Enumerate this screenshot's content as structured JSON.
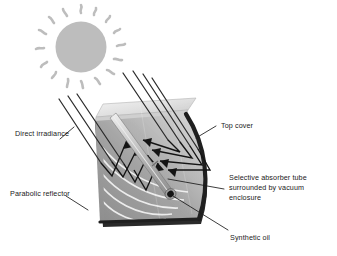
{
  "figure": {
    "background_color": "#ffffff"
  },
  "labels": {
    "direct_irradiance": "Direct irradiance",
    "parabolic_reflector": "Parabolic reflector",
    "top_cover": "Top cover",
    "absorber_tube_line1": "Selective absorber tube",
    "absorber_tube_line2": "surrounded by vacuum",
    "absorber_tube_line3": "enclosure",
    "synthetic_oil": "Synthetic oil"
  },
  "elements": {
    "sun": {
      "name": "sun",
      "fill": "#bdbdbd",
      "ray_count": 16
    },
    "incoming_rays": {
      "name": "direct-irradiance-rays",
      "count": 7,
      "color": "#2b2b2b"
    },
    "reflected_rays": {
      "name": "reflected-ray-arrows",
      "count": 4,
      "color": "#1a1a1a"
    },
    "reflector": {
      "name": "parabolic-reflector",
      "fill": "#9a9a9a",
      "band_color": "#f2f2f2",
      "rim_color": "#262626"
    },
    "top_cover": {
      "name": "top-cover-panel",
      "fill": "#e2e2e2"
    },
    "absorber_tube": {
      "name": "selective-absorber-tube",
      "fill": "#b5b5b5",
      "end_fill": "#1a1a1a"
    }
  },
  "colors": {
    "line": "#1a1a1a",
    "text": "#1a1a1a",
    "sun": "#bdbdbd",
    "reflector_dark": "#8f8f8f",
    "reflector_light": "#c6c6c6",
    "rim": "#242424"
  }
}
